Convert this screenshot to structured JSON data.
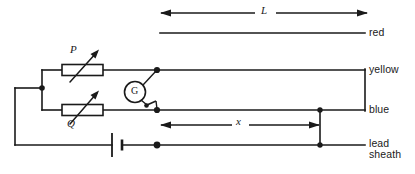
{
  "diagram": {
    "conductor_labels": {
      "red": "red",
      "yellow": "yellow",
      "blue": "blue",
      "lead_sheath_line1": "lead",
      "lead_sheath_line2": "sheath"
    },
    "dimensions": [
      {
        "name": "total-length",
        "symbol": "L",
        "style": "double-headed-arrow"
      },
      {
        "name": "fault-distance",
        "symbol": "x",
        "style": "double-headed-arrow"
      }
    ],
    "components": [
      {
        "name": "variable-resistor-p",
        "label": "P",
        "type": "variable-resistor"
      },
      {
        "name": "variable-resistor-q",
        "label": "Q",
        "type": "variable-resistor"
      },
      {
        "name": "galvanometer",
        "label": "G",
        "type": "galvanometer"
      },
      {
        "name": "battery",
        "label": "",
        "type": "cell"
      }
    ],
    "colors": {
      "ink": "#1a1a1a",
      "background": "#ffffff"
    }
  }
}
